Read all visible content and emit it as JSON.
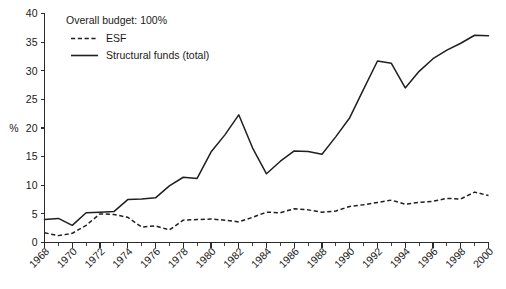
{
  "chart_data": {
    "type": "line",
    "title": "",
    "xlabel": "",
    "ylabel": "%",
    "xlim": [
      1968,
      2000
    ],
    "ylim": [
      0,
      40
    ],
    "yticks": [
      0,
      5,
      10,
      15,
      20,
      25,
      30,
      35,
      40
    ],
    "xticks": [
      1968,
      1970,
      1972,
      1974,
      1976,
      1978,
      1980,
      1982,
      1984,
      1986,
      1988,
      1990,
      1992,
      1994,
      1996,
      1998,
      2000
    ],
    "xtick_labels": [
      "1968",
      "1970",
      "1972",
      "1974",
      "1976",
      "1978",
      "1980",
      "1982",
      "1984",
      "1986",
      "1988",
      "1990",
      "1992",
      "1994",
      "1996",
      "1998",
      "2000"
    ],
    "ytick_labels": [
      "0",
      "5",
      "10",
      "15",
      "20",
      "25",
      "30",
      "35",
      "40"
    ],
    "grid": false,
    "legend_position": "top-left",
    "annotation": "Overall budget: 100%",
    "x": [
      1968,
      1969,
      1970,
      1971,
      1972,
      1973,
      1974,
      1975,
      1976,
      1977,
      1978,
      1979,
      1980,
      1981,
      1982,
      1983,
      1984,
      1985,
      1986,
      1987,
      1988,
      1989,
      1990,
      1991,
      1992,
      1993,
      1994,
      1995,
      1996,
      1997,
      1998,
      1999,
      2000
    ],
    "series": [
      {
        "name": "ESF",
        "style": "dashed",
        "color": "#1f1f1f",
        "values": [
          1.7,
          1.2,
          1.6,
          3.0,
          5.0,
          4.9,
          4.4,
          2.7,
          2.9,
          2.2,
          3.9,
          4.0,
          4.1,
          3.9,
          3.6,
          4.4,
          5.3,
          5.2,
          5.9,
          5.7,
          5.3,
          5.5,
          6.3,
          6.6,
          7.0,
          7.4,
          6.7,
          7.0,
          7.2,
          7.7,
          7.6,
          8.8,
          8.2
        ]
      },
      {
        "name": "Structural funds (total)",
        "style": "solid",
        "color": "#1f1f1f",
        "values": [
          4.0,
          4.2,
          3.0,
          5.2,
          5.3,
          5.4,
          7.5,
          7.6,
          7.8,
          9.9,
          11.4,
          11.2,
          15.8,
          18.8,
          22.3,
          16.5,
          12.0,
          14.2,
          16.0,
          15.9,
          15.4,
          18.5,
          21.8,
          26.8,
          31.7,
          31.3,
          27.0,
          29.9,
          32.1,
          33.6,
          34.8,
          36.2,
          36.1
        ]
      }
    ]
  },
  "legend": {
    "annotation_label": "Overall budget: 100%",
    "items": [
      {
        "label": "ESF",
        "style": "dashed"
      },
      {
        "label": "Structural funds (total)",
        "style": "solid"
      }
    ]
  },
  "axis": {
    "y_axis_title": "%"
  }
}
